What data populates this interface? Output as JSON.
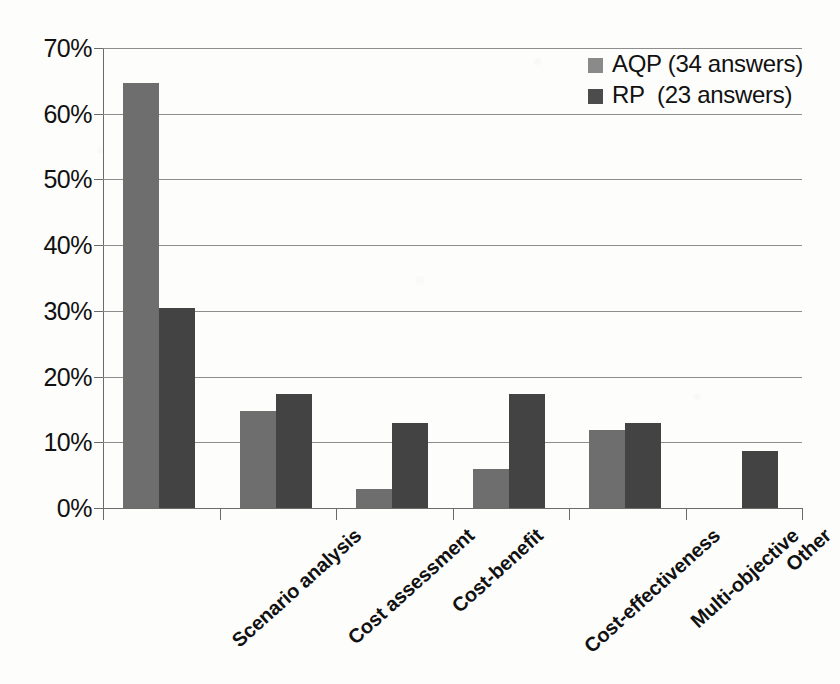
{
  "chart_data": {
    "type": "bar",
    "title": "",
    "subtitle": "",
    "xlabel": "",
    "ylabel": "",
    "ylim": [
      0,
      70
    ],
    "ytick_labels": [
      "70%",
      "60%",
      "50%",
      "40%",
      "30%",
      "20%",
      "10%",
      "0%"
    ],
    "ytick_values": [
      70,
      60,
      50,
      40,
      30,
      20,
      10,
      0
    ],
    "ytick_step": 10,
    "grid": true,
    "grid_axis": "y",
    "legend_position": "top-right",
    "legend_border": false,
    "categories": [
      "Scenario analysis",
      "Cost assessment",
      "Cost-benefit",
      "Cost-effectiveness",
      "Multi-objective",
      "Other"
    ],
    "series": [
      {
        "name": "AQP",
        "legend_label": "AQP (34 answers)",
        "answers": 34,
        "color": "#6e6e6e",
        "values": [
          64.7,
          14.7,
          2.9,
          5.9,
          11.8,
          0
        ]
      },
      {
        "name": "RP",
        "legend_label": "RP  (23 answers)",
        "answers": 23,
        "color": "#434343",
        "values": [
          30.4,
          17.4,
          13.0,
          17.4,
          13.0,
          8.7
        ]
      }
    ],
    "axis_color": "#6b6b6b",
    "gridline_color": "#8d8d8d",
    "background": "#fdfdfc"
  }
}
